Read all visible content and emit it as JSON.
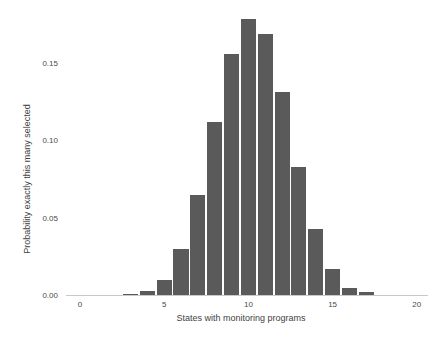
{
  "chart_data": {
    "type": "bar",
    "title": "",
    "xlabel": "States with monitoring programs",
    "ylabel": "Probability exactly this many selected",
    "categories": [
      3,
      4,
      5,
      6,
      7,
      8,
      9,
      10,
      11,
      12,
      13,
      14,
      15,
      16,
      17
    ],
    "values": [
      0.001,
      0.0025,
      0.01,
      0.03,
      0.065,
      0.112,
      0.156,
      0.179,
      0.169,
      0.132,
      0.083,
      0.043,
      0.017,
      0.005,
      0.002
    ],
    "x_ticks": [
      0,
      5,
      10,
      15,
      20
    ],
    "x_tick_labels": [
      "0",
      "5",
      "10",
      "15",
      "20"
    ],
    "y_ticks": [
      0.0,
      0.05,
      0.1,
      0.15
    ],
    "y_tick_labels": [
      "0.00",
      "0.05",
      "0.10",
      "0.15"
    ],
    "xlim": [
      -0.85,
      20.8
    ],
    "ylim": [
      0,
      0.183
    ],
    "grid": false,
    "legend_position": "none",
    "bar_color": "#5a5a5a",
    "axis_line_color": "#c9c9c9",
    "tick_text_color": "#4a4a4a",
    "title_text_color": "#3f3f3f",
    "background_color": "#ffffff"
  }
}
